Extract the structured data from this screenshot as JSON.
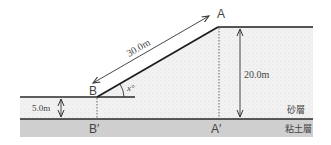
{
  "diagram": {
    "points": {
      "A": "A",
      "B": "B",
      "A_prime": "A′",
      "B_prime": "B′"
    },
    "dimensions": {
      "slope_length": "30.0m",
      "height_A": "20.0m",
      "height_B": "5.0m",
      "angle": "x°"
    },
    "layers": {
      "sand": "砂層",
      "clay": "粘土層"
    },
    "colors": {
      "line": "#2a2a2a",
      "sand_fill": "#f1f1f1",
      "clay_fill": "#cfcfcf",
      "text": "#444444"
    }
  }
}
